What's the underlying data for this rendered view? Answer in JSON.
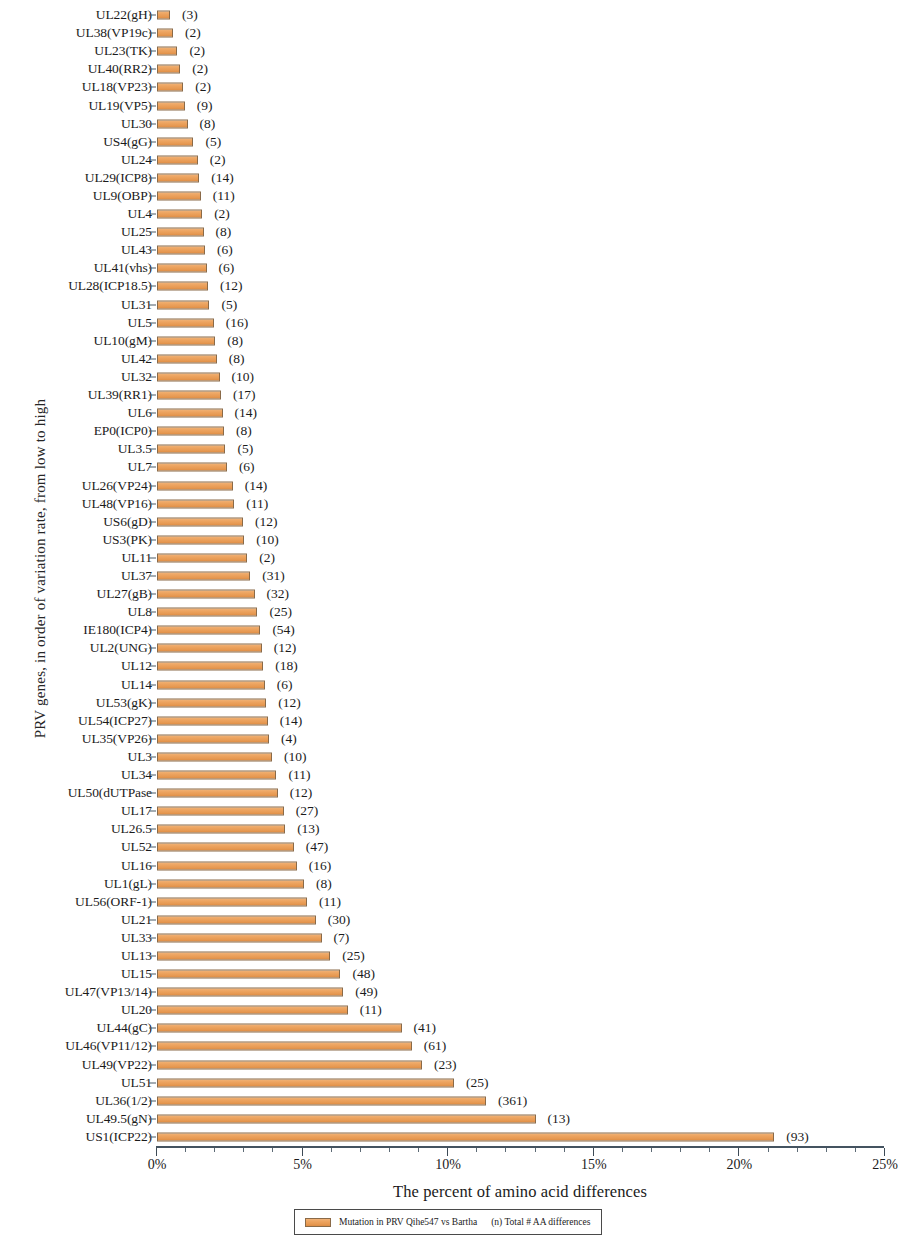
{
  "chart_data": {
    "type": "bar",
    "orientation": "horizontal",
    "title": "",
    "xlabel": "The percent of amino acid differences",
    "ylabel": "PRV genes, in order of variation rate, from low to high",
    "xlim": [
      0,
      25
    ],
    "xtick_labels": [
      "0%",
      "5%",
      "10%",
      "15%",
      "20%",
      "25%"
    ],
    "xtick_values": [
      0,
      5,
      10,
      15,
      20,
      25
    ],
    "xtick_minor_step": 1,
    "grid": false,
    "value_unit": "%",
    "legend_position": "bottom-center",
    "legend": [
      {
        "label": "Mutation in PRV Qihe547 vs Bartha",
        "color": "#e79a53"
      }
    ],
    "legend_note": "(n)  Total # AA differences",
    "annotation_format": "(n) = total number of amino acid differences",
    "categories": [
      "UL22(gH)",
      "UL38(VP19c)",
      "UL23(TK)",
      "UL40(RR2)",
      "UL18(VP23)",
      "UL19(VP5)",
      "UL30",
      "US4(gG)",
      "UL24",
      "UL29(ICP8)",
      "UL9(OBP)",
      "UL4",
      "UL25",
      "UL43",
      "UL41(vhs)",
      "UL28(ICP18.5)",
      "UL31",
      "UL5",
      "UL10(gM)",
      "UL42",
      "UL32",
      "UL39(RR1)",
      "UL6",
      "EP0(ICP0)",
      "UL3.5",
      "UL7",
      "UL26(VP24)",
      "UL48(VP16)",
      "US6(gD)",
      "US3(PK)",
      "UL11",
      "UL37",
      "UL27(gB)",
      "UL8",
      "IE180(ICP4)",
      "UL2(UNG)",
      "UL12",
      "UL14",
      "UL53(gK)",
      "UL54(ICP27)",
      "UL35(VP26)",
      "UL3",
      "UL34",
      "UL50(dUTPase",
      "UL17",
      "UL26.5",
      "UL52",
      "UL16",
      "UL1(gL)",
      "UL56(ORF-1)",
      "UL21",
      "UL33",
      "UL13",
      "UL15",
      "UL47(VP13/14)",
      "UL20",
      "UL44(gC)",
      "UL46(VP11/12)",
      "UL49(VP22)",
      "UL51",
      "UL36(1/2)",
      "UL49.5(gN)",
      "US1(ICP22)"
    ],
    "values": [
      0.45,
      0.55,
      0.7,
      0.8,
      0.9,
      0.95,
      1.05,
      1.25,
      1.4,
      1.45,
      1.5,
      1.55,
      1.6,
      1.65,
      1.7,
      1.75,
      1.8,
      1.95,
      2.0,
      2.05,
      2.15,
      2.2,
      2.25,
      2.3,
      2.35,
      2.4,
      2.6,
      2.65,
      2.95,
      3.0,
      3.1,
      3.2,
      3.35,
      3.45,
      3.55,
      3.6,
      3.65,
      3.7,
      3.75,
      3.8,
      3.85,
      3.95,
      4.1,
      4.15,
      4.35,
      4.4,
      4.7,
      4.8,
      5.05,
      5.15,
      5.45,
      5.65,
      5.95,
      6.3,
      6.4,
      6.55,
      8.4,
      8.75,
      9.1,
      10.2,
      11.3,
      13.0,
      21.2
    ],
    "annotations": [
      "(3)",
      "(2)",
      "(2)",
      "(2)",
      "(2)",
      "(9)",
      "(8)",
      "(5)",
      "(2)",
      "(14)",
      "(11)",
      "(2)",
      "(8)",
      "(6)",
      "(6)",
      "(12)",
      "(5)",
      "(16)",
      "(8)",
      "(8)",
      "(10)",
      "(17)",
      "(14)",
      "(8)",
      "(5)",
      "(6)",
      "(14)",
      "(11)",
      "(12)",
      "(10)",
      "(2)",
      "(31)",
      "(32)",
      "(25)",
      "(54)",
      "(12)",
      "(18)",
      "(6)",
      "(12)",
      "(14)",
      "(4)",
      "(10)",
      "(11)",
      "(12)",
      "(27)",
      "(13)",
      "(47)",
      "(16)",
      "(8)",
      "(11)",
      "(30)",
      "(7)",
      "(25)",
      "(48)",
      "(49)",
      "(11)",
      "(41)",
      "(61)",
      "(23)",
      "(25)",
      "(361)",
      "(13)",
      "(93)"
    ],
    "annotation_counts": [
      3,
      2,
      2,
      2,
      2,
      9,
      8,
      5,
      2,
      14,
      11,
      2,
      8,
      6,
      6,
      12,
      5,
      16,
      8,
      8,
      10,
      17,
      14,
      8,
      5,
      6,
      14,
      11,
      12,
      10,
      2,
      31,
      32,
      25,
      54,
      12,
      18,
      6,
      12,
      14,
      4,
      10,
      11,
      12,
      27,
      13,
      47,
      16,
      8,
      11,
      30,
      7,
      25,
      48,
      49,
      11,
      41,
      61,
      23,
      25,
      361,
      13,
      93
    ],
    "series_color": "#e79a53",
    "series_border_color": "#8a6a48",
    "axis_color": "#445360"
  }
}
